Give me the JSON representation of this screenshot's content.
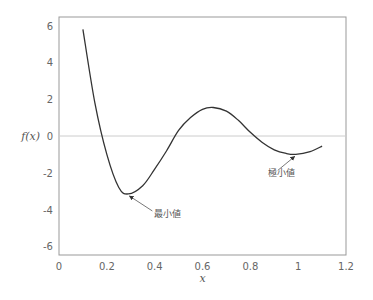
{
  "chart_data": {
    "type": "line",
    "title": "",
    "xlabel": "x",
    "ylabel": "f(x)",
    "xlim": [
      0,
      1.2
    ],
    "ylim": [
      -6.4,
      6.4
    ],
    "xticks": [
      "0",
      "0.2",
      "0.4",
      "0.6",
      "0.8",
      "1",
      "1.2"
    ],
    "yticks": [
      "6",
      "4",
      "2",
      "0",
      "-2",
      "-4",
      "-6"
    ],
    "grid": false,
    "zero_line": true,
    "series": [
      {
        "name": "f(x)",
        "x": [
          0.1,
          0.15,
          0.2,
          0.25,
          0.29,
          0.35,
          0.4,
          0.45,
          0.5,
          0.55,
          0.6,
          0.645,
          0.7,
          0.75,
          0.8,
          0.85,
          0.9,
          0.95,
          0.99,
          1.05,
          1.1
        ],
        "values": [
          5.8,
          1.8,
          -1.0,
          -2.8,
          -3.15,
          -2.7,
          -1.8,
          -0.8,
          0.3,
          1.0,
          1.45,
          1.55,
          1.35,
          0.85,
          0.2,
          -0.35,
          -0.75,
          -0.95,
          -1.0,
          -0.85,
          -0.55
        ]
      }
    ],
    "annotations": [
      {
        "text": "最小値",
        "x": 0.29,
        "y": -3.15
      },
      {
        "text": "極小値",
        "x": 0.99,
        "y": -1.0
      }
    ]
  }
}
